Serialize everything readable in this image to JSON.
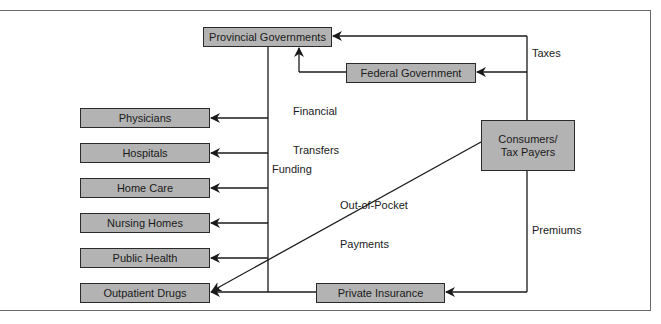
{
  "diagram": {
    "nodes": {
      "provincial": "Provincial Governments",
      "federal": "Federal Government",
      "consumers_line1": "Consumers/",
      "consumers_line2": "Tax Payers",
      "private_insurance": "Private Insurance",
      "providers": [
        "Physicians",
        "Hospitals",
        "Home Care",
        "Nursing Homes",
        "Public Health",
        "Outpatient Drugs"
      ]
    },
    "edge_labels": {
      "taxes": "Taxes",
      "financial_transfers_line1": "Financial",
      "financial_transfers_line2": "Transfers",
      "funding": "Funding",
      "out_of_pocket_line1": "Out-of-Pocket",
      "out_of_pocket_line2": "Payments",
      "premiums": "Premiums"
    },
    "colors": {
      "box_fill": "#b3b3b3",
      "box_border": "#2a2a2a",
      "line": "#1a1a1a"
    }
  }
}
